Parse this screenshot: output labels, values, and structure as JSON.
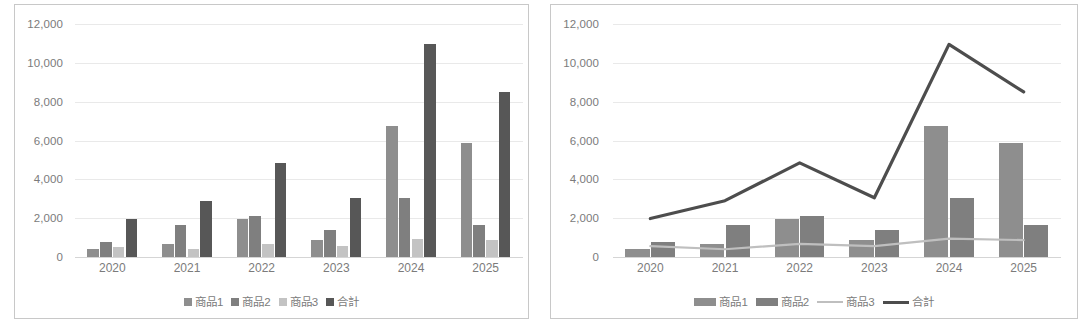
{
  "charts": [
    {
      "panel_name": "bar-chart-panel",
      "legend_style": "boxes",
      "chart_data": {
        "type": "bar",
        "title": "",
        "xlabel": "",
        "ylabel": "",
        "categories": [
          "2020",
          "2021",
          "2022",
          "2023",
          "2024",
          "2025"
        ],
        "ylim": [
          0,
          12000
        ],
        "ytick_labels": [
          "0",
          "2,000",
          "4,000",
          "6,000",
          "8,000",
          "10,000",
          "12,000"
        ],
        "yticks": [
          0,
          2000,
          4000,
          6000,
          8000,
          10000,
          12000
        ],
        "grid": true,
        "legend_position": "bottom",
        "series": [
          {
            "name": "商品1",
            "type": "bar",
            "color": "#8e8e8e",
            "values": [
              420,
              660,
              1950,
              880,
              6750,
              5850
            ]
          },
          {
            "name": "商品2",
            "type": "bar",
            "color": "#7f7f7f",
            "values": [
              780,
              1650,
              2110,
              1400,
              3050,
              1670
            ]
          },
          {
            "name": "商品3",
            "type": "bar",
            "color": "#c3c3c3",
            "values": [
              520,
              400,
              680,
              560,
              950,
              870
            ]
          },
          {
            "name": "合計",
            "type": "bar",
            "color": "#575757",
            "values": [
              1980,
              2900,
              4850,
              3050,
              10950,
              8500
            ]
          }
        ]
      }
    },
    {
      "panel_name": "combo-chart-panel",
      "legend_style": "mixed",
      "chart_data": {
        "type": "bar",
        "title": "",
        "xlabel": "",
        "ylabel": "",
        "categories": [
          "2020",
          "2021",
          "2022",
          "2023",
          "2024",
          "2025"
        ],
        "ylim": [
          0,
          12000
        ],
        "ytick_labels": [
          "0",
          "2,000",
          "4,000",
          "6,000",
          "8,000",
          "10,000",
          "12,000"
        ],
        "yticks": [
          0,
          2000,
          4000,
          6000,
          8000,
          10000,
          12000
        ],
        "grid": true,
        "legend_position": "bottom",
        "series": [
          {
            "name": "商品1",
            "type": "bar",
            "color": "#8e8e8e",
            "values": [
              420,
              660,
              1950,
              880,
              6750,
              5850
            ]
          },
          {
            "name": "商品2",
            "type": "bar",
            "color": "#7f7f7f",
            "values": [
              780,
              1650,
              2110,
              1400,
              3050,
              1670
            ]
          },
          {
            "name": "商品3",
            "type": "line",
            "color": "#bfbfbf",
            "values": [
              560,
              400,
              680,
              560,
              950,
              870
            ]
          },
          {
            "name": "合計",
            "type": "line",
            "color": "#4d4d4d",
            "values": [
              1980,
              2900,
              4850,
              3050,
              10950,
              8500
            ]
          }
        ]
      }
    }
  ],
  "colors": {
    "grid": "#e9e9e9",
    "axis": "#d5d5d5",
    "text": "#7b7b7b",
    "panel_border": "#c8c8c8",
    "background": "#ffffff"
  }
}
